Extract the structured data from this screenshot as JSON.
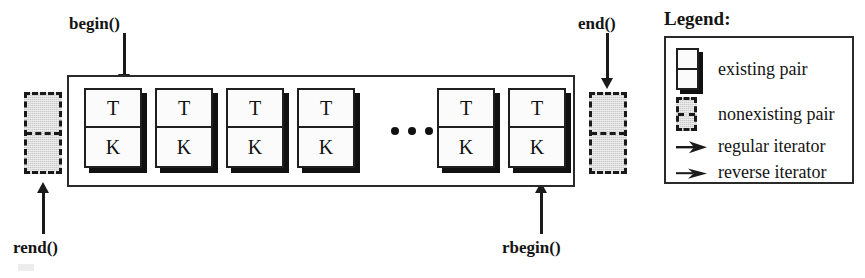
{
  "diagram": {
    "container": {
      "x": 67,
      "y": 75,
      "width": 508,
      "height": 112
    },
    "pair_label_top": "T",
    "pair_label_bottom": "K",
    "pairs": [
      {
        "id": "pair-1",
        "top": "T",
        "bottom": "K",
        "x": 84,
        "y": 88
      },
      {
        "id": "pair-2",
        "top": "T",
        "bottom": "K",
        "x": 155,
        "y": 88
      },
      {
        "id": "pair-3",
        "top": "T",
        "bottom": "K",
        "x": 226,
        "y": 88
      },
      {
        "id": "pair-4",
        "top": "T",
        "bottom": "K",
        "x": 297,
        "y": 88
      },
      {
        "id": "pair-5",
        "top": "T",
        "bottom": "K",
        "x": 437,
        "y": 88
      },
      {
        "id": "pair-6",
        "top": "T",
        "bottom": "K",
        "x": 508,
        "y": 88
      }
    ],
    "nonexisting_pairs": [
      {
        "id": "nonpair-left",
        "x": 24,
        "y": 92,
        "width": 38,
        "height": 82
      },
      {
        "id": "nonpair-right",
        "x": 589,
        "y": 92,
        "width": 38,
        "height": 82
      }
    ],
    "ellipsis": {
      "x": 391,
      "y": 127,
      "dots": 3
    },
    "pointers": [
      {
        "id": "begin",
        "label": "begin()",
        "direction": "down",
        "label_x": 69,
        "label_y": 14,
        "arrow_x": 124,
        "arrow_y": 33,
        "arrow_height": 52
      },
      {
        "id": "end",
        "label": "end()",
        "direction": "down",
        "label_x": 578,
        "label_y": 14,
        "arrow_x": 607,
        "arrow_y": 33,
        "arrow_height": 56
      },
      {
        "id": "rend",
        "label": "rend()",
        "direction": "up",
        "label_x": 13,
        "label_y": 238,
        "arrow_x": 43,
        "arrow_y": 182,
        "arrow_height": 52
      },
      {
        "id": "rbegin",
        "label": "rbegin()",
        "direction": "up",
        "label_x": 502,
        "label_y": 238,
        "arrow_x": 541,
        "arrow_y": 182,
        "arrow_height": 52
      }
    ]
  },
  "legend": {
    "title": "Legend:",
    "box": {
      "x": 664,
      "y": 36,
      "width": 190,
      "height": 148
    },
    "items": [
      {
        "id": "existing-pair",
        "icon": "existing-pair-icon",
        "label": "existing pair",
        "y": 10
      },
      {
        "id": "nonexisting-pair",
        "icon": "nonexisting-pair-icon",
        "label": "nonexisting pair",
        "y": 59
      },
      {
        "id": "regular-iterator",
        "icon": "regular-iterator-icon",
        "label": "regular iterator",
        "y": 98
      },
      {
        "id": "reverse-iterator",
        "icon": "reverse-iterator-icon",
        "label": "reverse iterator",
        "y": 124
      }
    ]
  },
  "colors": {
    "ink": "#1a1a1a",
    "box_fill": "#fbfbfb",
    "shadow": "#111111",
    "nonexisting_fill": "#c9c9c9",
    "background": "#ffffff"
  }
}
